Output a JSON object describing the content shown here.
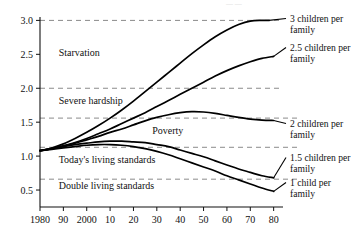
{
  "chart_data": {
    "type": "line",
    "title": "",
    "xlabel": "",
    "ylabel": "",
    "xlim": [
      1980,
      2084
    ],
    "ylim": [
      0.25,
      3.05
    ],
    "grid": true,
    "legend_position": "right-of-plot (inline end-of-line labels)",
    "x_tick_labels": [
      "1980",
      "90",
      "2000",
      "10",
      "20",
      "30",
      "40",
      "50",
      "60",
      "70",
      "80"
    ],
    "x_tick_values": [
      1980,
      1990,
      2000,
      2010,
      2020,
      2030,
      2040,
      2050,
      2060,
      2070,
      2080
    ],
    "y_tick_labels": [
      "0.5",
      "1.0",
      "1.5",
      "2.0",
      "2.5",
      "3.0"
    ],
    "y_tick_values": [
      0.5,
      1.0,
      1.5,
      2.0,
      2.5,
      3.0
    ],
    "gridlines_y": [
      0.66,
      1.13,
      1.56,
      2.0,
      3.0
    ],
    "band_annotations": [
      {
        "label": "Starvation",
        "y": 2.48,
        "x": 1988
      },
      {
        "label": "Severe hardship",
        "y": 1.77,
        "x": 1988
      },
      {
        "label": "Poverty",
        "y": 1.33,
        "x": 2028
      },
      {
        "label": "Today's living standards",
        "y": 0.9,
        "x": 1988
      },
      {
        "label": "Double living standards",
        "y": 0.52,
        "x": 1988
      }
    ],
    "series": [
      {
        "name": "3 children per family",
        "label_lines": [
          "3 children per",
          "family"
        ],
        "x": [
          1980,
          1985,
          1990,
          1995,
          2000,
          2005,
          2010,
          2015,
          2020,
          2025,
          2030,
          2035,
          2040,
          2045,
          2050,
          2055,
          2060,
          2065,
          2070,
          2075,
          2078
        ],
        "values": [
          1.08,
          1.12,
          1.18,
          1.26,
          1.35,
          1.45,
          1.56,
          1.68,
          1.81,
          1.95,
          2.09,
          2.23,
          2.37,
          2.51,
          2.64,
          2.76,
          2.86,
          2.94,
          2.99,
          3.0,
          3.0
        ]
      },
      {
        "name": "2.5 children per family",
        "label_lines": [
          "2.5 children per",
          "family"
        ],
        "x": [
          1980,
          1985,
          1990,
          1995,
          2000,
          2005,
          2010,
          2015,
          2020,
          2025,
          2030,
          2035,
          2040,
          2045,
          2050,
          2055,
          2060,
          2065,
          2070,
          2075,
          2080
        ],
        "values": [
          1.08,
          1.11,
          1.15,
          1.2,
          1.26,
          1.33,
          1.4,
          1.48,
          1.56,
          1.64,
          1.73,
          1.82,
          1.91,
          2.0,
          2.09,
          2.18,
          2.26,
          2.33,
          2.39,
          2.44,
          2.47
        ]
      },
      {
        "name": "2 children per family",
        "label_lines": [
          "2 children per",
          "family"
        ],
        "x": [
          1980,
          1985,
          1990,
          1995,
          2000,
          2005,
          2010,
          2015,
          2020,
          2025,
          2030,
          2035,
          2040,
          2045,
          2050,
          2055,
          2060,
          2065,
          2070,
          2075,
          2080
        ],
        "values": [
          1.08,
          1.11,
          1.15,
          1.19,
          1.24,
          1.29,
          1.35,
          1.4,
          1.46,
          1.52,
          1.57,
          1.61,
          1.64,
          1.655,
          1.65,
          1.63,
          1.6,
          1.57,
          1.545,
          1.53,
          1.525
        ]
      },
      {
        "name": "1.5 children per family",
        "label_lines": [
          "1.5 children per",
          "family"
        ],
        "x": [
          1980,
          1985,
          1990,
          1995,
          2000,
          2005,
          2010,
          2015,
          2020,
          2025,
          2030,
          2035,
          2040,
          2045,
          2050,
          2055,
          2060,
          2065,
          2070,
          2075,
          2080
        ],
        "values": [
          1.08,
          1.11,
          1.14,
          1.17,
          1.19,
          1.21,
          1.22,
          1.22,
          1.21,
          1.2,
          1.17,
          1.14,
          1.09,
          1.04,
          0.99,
          0.93,
          0.87,
          0.81,
          0.76,
          0.71,
          0.68
        ]
      },
      {
        "name": "1 child per family",
        "label_lines": [
          "1 child per",
          "family"
        ],
        "x": [
          1980,
          1985,
          1990,
          1995,
          2000,
          2005,
          2010,
          2015,
          2020,
          2025,
          2030,
          2035,
          2040,
          2045,
          2050,
          2055,
          2060,
          2065,
          2070,
          2075,
          2080
        ],
        "values": [
          1.08,
          1.1,
          1.12,
          1.14,
          1.16,
          1.17,
          1.17,
          1.16,
          1.14,
          1.11,
          1.07,
          1.02,
          0.96,
          0.9,
          0.84,
          0.78,
          0.71,
          0.65,
          0.59,
          0.53,
          0.48
        ]
      }
    ],
    "colors": {
      "curve": "#000000",
      "gridline": "#8a8a8a",
      "axis": "#111111",
      "background": "#ffffff"
    }
  }
}
